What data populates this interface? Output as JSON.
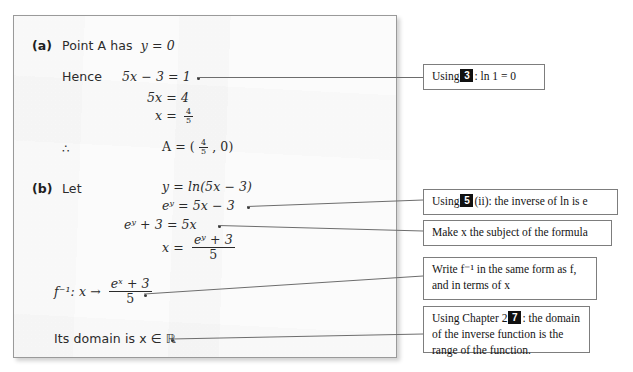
{
  "solution": {
    "parts": [
      {
        "label": "(a)"
      },
      {
        "label": "(b)"
      }
    ],
    "lines": {
      "a_statement": "Point A has",
      "a_statement_math": "y = 0",
      "hence_label": "Hence",
      "hence_eq": "5x − 3 = 1",
      "line_5x4": "5x = 4",
      "line_x_eq": "x =",
      "frac_4_5": {
        "num": "4",
        "den": "5"
      },
      "therefore_symbol": "∴",
      "point_a": "A = (",
      "point_a_tail": ", 0)",
      "let_label": "Let",
      "b_line1": "y = ln(5x − 3)",
      "b_line2": "eʸ = 5x − 3",
      "b_line3": "eʸ + 3 = 5x",
      "b_line4_lhs": "x =",
      "b_line4_frac": {
        "num": "eʸ + 3",
        "den": "5"
      },
      "finv_lhs": "f⁻¹: x →",
      "finv_frac": {
        "num": "eˣ + 3",
        "den": "5"
      },
      "domain_line": "Its domain is x ∈ ℝ"
    }
  },
  "callouts": [
    {
      "id": "callout-ln1",
      "prefix": "Using",
      "badge": "3",
      "suffix": ": ln 1 = 0"
    },
    {
      "id": "callout-inverse-ln",
      "prefix": "Using",
      "badge": "5",
      "suffix": "(ii): the inverse of ln is e"
    },
    {
      "id": "callout-make-x-subject",
      "text": "Make x the subject of the formula"
    },
    {
      "id": "callout-write-finv",
      "text": "Write f⁻¹ in the same form as f, and in terms of x"
    },
    {
      "id": "callout-domain-range",
      "prefix": "Using Chapter 2",
      "badge": "7",
      "suffix": ": the domain of the inverse function is the range of the function."
    }
  ],
  "colors": {
    "page_background": "#fbfbfb",
    "page_border": "#9a9a9a",
    "ink": "#2b2b2b",
    "callout_border": "#7d7d7d",
    "badge_background": "#111111",
    "leader_line": "#6d6d6d"
  }
}
